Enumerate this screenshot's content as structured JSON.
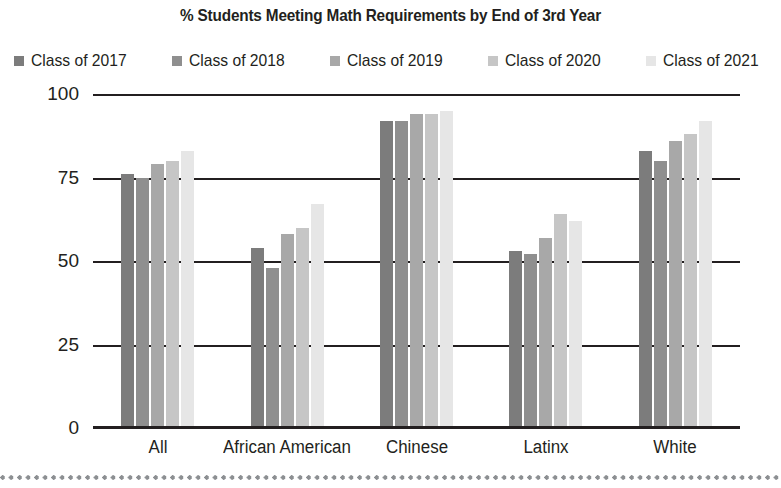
{
  "chart_data": {
    "type": "bar",
    "title": "% Students Meeting Math Requirements by End of 3rd Year",
    "xlabel": "",
    "ylabel": "",
    "categories": [
      "All",
      "African American",
      "Chinese",
      "Latinx",
      "White"
    ],
    "series": [
      {
        "name": "Class of 2017",
        "color": "#7c7c7c",
        "values": [
          76,
          54,
          92,
          53,
          83
        ]
      },
      {
        "name": "Class of 2018",
        "color": "#8f8f8f",
        "values": [
          75,
          48,
          92,
          52,
          80
        ]
      },
      {
        "name": "Class of 2019",
        "color": "#a8a8a8",
        "values": [
          79,
          58,
          94,
          57,
          86
        ]
      },
      {
        "name": "Class of 2020",
        "color": "#c6c6c6",
        "values": [
          80,
          60,
          94,
          64,
          88
        ]
      },
      {
        "name": "Class of 2021",
        "color": "#e6e6e6",
        "values": [
          83,
          67,
          95,
          62,
          92
        ]
      }
    ],
    "ylim": [
      0,
      100
    ],
    "yticks": [
      100,
      75,
      50,
      25,
      0
    ],
    "ytick_labels": [
      "100",
      "75",
      "50",
      "25",
      "0"
    ],
    "grid": true,
    "legend_position": "top"
  },
  "legend": {
    "items": [
      {
        "label": "Class of 2017",
        "swatch_name": "legend-swatch-class-of-2017"
      },
      {
        "label": "Class of 2018",
        "swatch_name": "legend-swatch-class-of-2018"
      },
      {
        "label": "Class of 2019",
        "swatch_name": "legend-swatch-class-of-2019"
      },
      {
        "label": "Class of 2020",
        "swatch_name": "legend-swatch-class-of-2020"
      },
      {
        "label": "Class of 2021",
        "swatch_name": "legend-swatch-class-of-2021"
      }
    ]
  },
  "colors": {
    "axis": "#231f20",
    "text": "#231f20",
    "background": "#ffffff",
    "dotted_rule": "#8c8f92"
  }
}
